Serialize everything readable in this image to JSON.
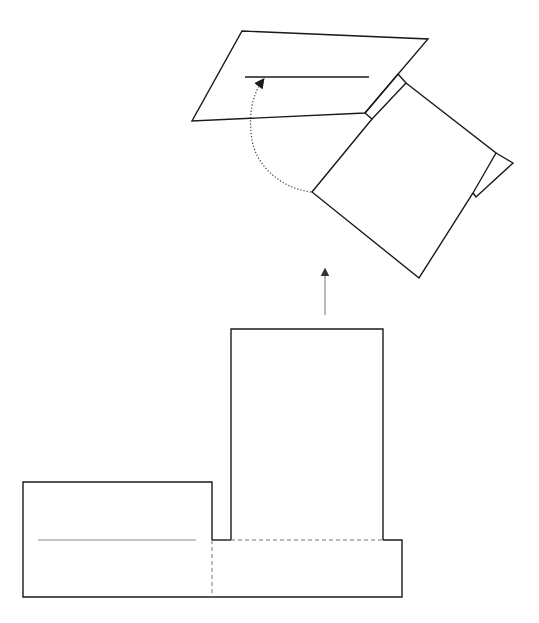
{
  "diagram": {
    "type": "folding-instruction",
    "colors": {
      "line": "#1a1a1a",
      "fold_line": "#777777",
      "crease": "#8a8a8a",
      "motion_arrow": "#444444"
    },
    "steps": [
      {
        "name": "unfolded-net",
        "parts": [
          "left-panel",
          "tall-panel",
          "base-strip",
          "valley-fold-vertical",
          "valley-fold-horizontal",
          "crease-line"
        ]
      },
      {
        "name": "folded-result",
        "parts": [
          "top-flap",
          "hinge-strip",
          "main-panel",
          "side-tab",
          "slit-line",
          "fold-motion-arrow"
        ]
      }
    ],
    "transition_arrow": {
      "direction": "up"
    }
  }
}
